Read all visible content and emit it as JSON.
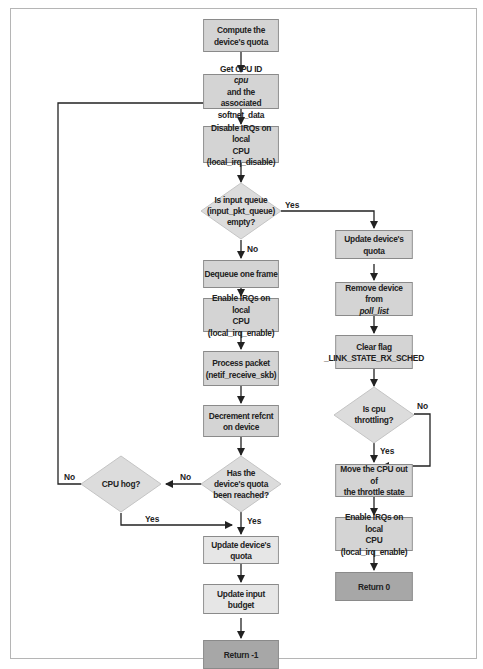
{
  "diagram": {
    "type": "flowchart",
    "colors": {
      "process": "#d4d4d4",
      "process_light": "#e6e6e6",
      "terminal": "#a7a7a7",
      "decision": "#dcdcdc",
      "border": "#8a8a8a",
      "line": "#222222"
    },
    "nodes": {
      "compute_quota": {
        "line1": "Compute the",
        "line2": "device's quota"
      },
      "get_cpu": {
        "line1_a": "Get CPU ID ",
        "line1_em": "cpu",
        "line1_b": " and the",
        "line2": "associated softnet_data"
      },
      "disable_irq": {
        "line1": "Disable IRQs on local",
        "line2": "CPU (local_irq_disable)"
      },
      "queue_empty": {
        "line1": "Is input queue",
        "line2": "(input_pkt_queue)",
        "line3": "empty?"
      },
      "dequeue": {
        "line1": "Dequeue one frame"
      },
      "enable_irq_left": {
        "line1": "Enable IRQs on local",
        "line2": "CPU (local_irq_enable)"
      },
      "process_packet": {
        "line1": "Process packet",
        "line2": "(netif_receive_skb)"
      },
      "decrement_refcnt": {
        "line1": "Decrement refcnt",
        "line2": "on device"
      },
      "quota_reached": {
        "line1": "Has the",
        "line2": "device's quota",
        "line3": "been reached?"
      },
      "cpu_hog": {
        "line1": "CPU hog?"
      },
      "update_quota_left": {
        "line1": "Update device's quota"
      },
      "update_budget": {
        "line1": "Update input budget"
      },
      "return_minus1": {
        "line1": "Return -1"
      },
      "update_quota_right": {
        "line1": "Update device's quota"
      },
      "remove_device": {
        "line1": "Remove device from",
        "line2": "poll_list"
      },
      "clear_flag": {
        "line1": "Clear flag",
        "line2": "_LINK_STATE_RX_SCHED"
      },
      "cpu_throttling": {
        "line1": "Is cpu",
        "line2": "throttling?"
      },
      "move_cpu": {
        "line1": "Move the CPU out of",
        "line2": "the throttle state"
      },
      "enable_irq_right": {
        "line1": "Enable IRQs on local",
        "line2": "CPU (local_irq_enable)"
      },
      "return_0": {
        "line1": "Return 0"
      }
    },
    "edge_labels": {
      "queue_yes": "Yes",
      "queue_no": "No",
      "quota_no": "No",
      "quota_yes": "Yes",
      "hog_no": "No",
      "hog_yes": "Yes",
      "throttle_no": "No",
      "throttle_yes": "Yes"
    }
  }
}
